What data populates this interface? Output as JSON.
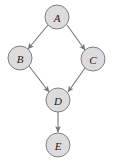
{
  "diagram": {
    "type": "directed-acyclic-graph",
    "title": "",
    "background_color": "#ffffff",
    "node_fill_color": "#dcdcdc",
    "node_stroke_color": "#808080",
    "edge_color": "#767676",
    "label_color": "#1a1a1a",
    "nodes": [
      {
        "id": "A",
        "label": "A",
        "cx": 57,
        "cy": 17,
        "r": 12
      },
      {
        "id": "B",
        "label": "B",
        "cx": 20,
        "cy": 58,
        "r": 12
      },
      {
        "id": "C",
        "label": "C",
        "cx": 93,
        "cy": 59,
        "r": 12
      },
      {
        "id": "D",
        "label": "D",
        "cx": 58,
        "cy": 100,
        "r": 12
      },
      {
        "id": "E",
        "label": "E",
        "cx": 58,
        "cy": 145,
        "r": 12
      }
    ],
    "edges": [
      {
        "from": "A",
        "to": "B",
        "x1": 48,
        "y1": 25,
        "x2": 28,
        "y2": 49
      },
      {
        "from": "A",
        "to": "C",
        "x1": 67,
        "y1": 25,
        "x2": 85,
        "y2": 50
      },
      {
        "from": "B",
        "to": "D",
        "x1": 29,
        "y1": 66,
        "x2": 49,
        "y2": 92
      },
      {
        "from": "C",
        "to": "D",
        "x1": 85,
        "y1": 68,
        "x2": 68,
        "y2": 92
      },
      {
        "from": "D",
        "to": "E",
        "x1": 58,
        "y1": 112,
        "x2": 58,
        "y2": 132
      }
    ]
  }
}
